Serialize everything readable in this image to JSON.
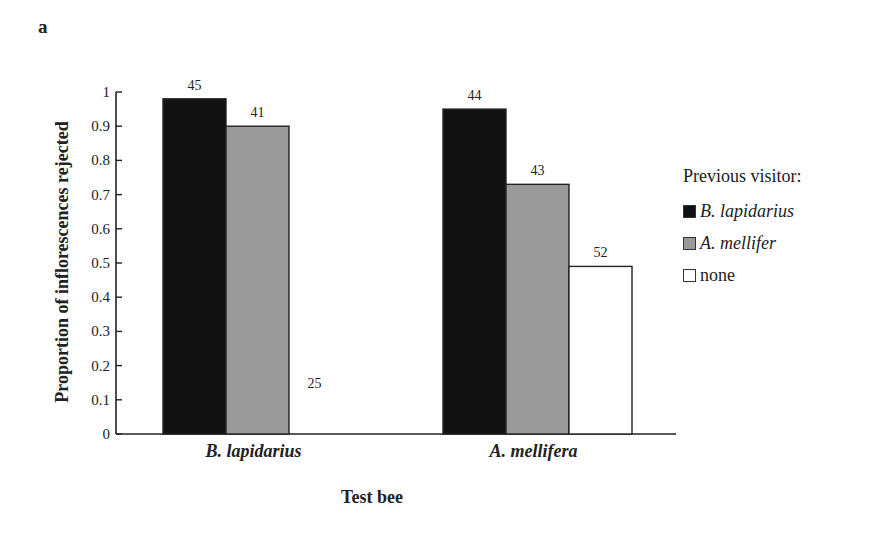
{
  "panel_label": "a",
  "chart_data": {
    "type": "bar",
    "title": "",
    "xlabel": "Test bee",
    "ylabel": "Proportion of inflorescences rejected",
    "ylim": [
      0,
      1
    ],
    "yticks": [
      "0",
      "0.1",
      "0.2",
      "0.3",
      "0.4",
      "0.5",
      "0.6",
      "0.7",
      "0.8",
      "0.9",
      "1"
    ],
    "grid": false,
    "legend_position": "right",
    "legend_title": "Previous visitor:",
    "categories": [
      "B. lapidarius",
      "A. mellifera"
    ],
    "series": [
      {
        "name": "B. lapidarius",
        "color": "#111111",
        "values": [
          0.98,
          0.95
        ],
        "n_labels": [
          "45",
          "44"
        ]
      },
      {
        "name": "A. mellifer",
        "color": "#9a9a9a",
        "values": [
          0.9,
          0.73
        ],
        "n_labels": [
          "41",
          "43"
        ]
      },
      {
        "name": "none",
        "color": "#ffffff",
        "values": [
          0.0,
          0.49
        ],
        "n_labels": [
          "25",
          "52"
        ]
      }
    ]
  }
}
